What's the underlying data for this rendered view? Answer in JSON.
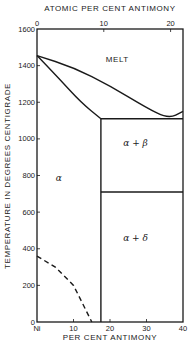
{
  "chart_data": {
    "type": "phase-diagram",
    "title": "",
    "top_axis": {
      "label": "ATOMIC PER CENT ANTIMONY",
      "ticks": [
        {
          "value": 0,
          "label": "0",
          "x_wt_pct": 0
        },
        {
          "value": 10,
          "label": "10",
          "x_wt_pct": 18.3
        },
        {
          "value": 20,
          "label": "20",
          "x_wt_pct": 36.6
        }
      ]
    },
    "xlabel": "PER CENT ANTIMONY",
    "xlim": [
      0,
      40
    ],
    "x_tick_labels": [
      "Ni",
      "10",
      "20",
      "30",
      "40"
    ],
    "ylabel": "TEMPERATURE IN DEGREES CENTIGRADE",
    "ylim": [
      0,
      1600
    ],
    "y_tick_labels": [
      "0",
      "200",
      "400",
      "600",
      "800",
      "1000",
      "1200",
      "1400",
      "1600"
    ],
    "regions": [
      {
        "label": "MELT",
        "x": 22,
        "y": 1420
      },
      {
        "label": "α",
        "x": 6,
        "y": 770
      },
      {
        "label": "α + β",
        "x": 27,
        "y": 960
      },
      {
        "label": "α + δ",
        "x": 27,
        "y": 440
      }
    ],
    "lines": [
      {
        "name": "liquidus",
        "style": "solid",
        "points": [
          [
            0,
            1455
          ],
          [
            10,
            1390
          ],
          [
            20,
            1290
          ],
          [
            30,
            1170
          ],
          [
            36,
            1110
          ],
          [
            40,
            1150
          ]
        ]
      },
      {
        "name": "solidus",
        "style": "solid",
        "points": [
          [
            0,
            1455
          ],
          [
            6,
            1330
          ],
          [
            12,
            1200
          ],
          [
            17.5,
            1110
          ]
        ]
      },
      {
        "name": "eutectic-horizontal",
        "style": "solid",
        "points": [
          [
            17.5,
            1110
          ],
          [
            40,
            1110
          ]
        ]
      },
      {
        "name": "eutectoid-horizontal",
        "style": "solid",
        "points": [
          [
            17.5,
            710
          ],
          [
            40,
            710
          ]
        ]
      },
      {
        "name": "alpha-solvus",
        "style": "solid",
        "points": [
          [
            17.5,
            1110
          ],
          [
            17.5,
            0
          ]
        ]
      },
      {
        "name": "magnetic-transformation",
        "style": "dashed",
        "points": [
          [
            0,
            360
          ],
          [
            5,
            300
          ],
          [
            10,
            200
          ],
          [
            15,
            0
          ]
        ]
      }
    ]
  }
}
